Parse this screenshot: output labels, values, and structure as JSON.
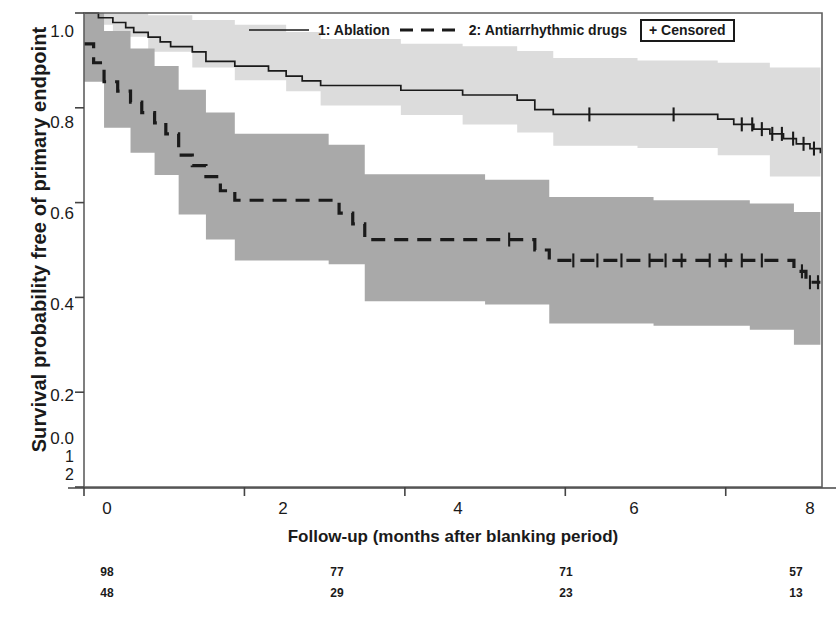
{
  "chart_data": {
    "type": "line",
    "chart_kind": "kaplan-meier-survival",
    "title": "",
    "xlabel": "Follow-up (months after blanking period)",
    "ylabel": "Survival probability free of primary endpoint",
    "xlim": [
      0,
      9.2
    ],
    "ylim": [
      0.0,
      1.0
    ],
    "xticks": [
      0,
      2,
      4,
      6,
      8
    ],
    "xtick_labels": [
      "0",
      "2",
      "4",
      "6",
      "8"
    ],
    "yticks": [
      0.0,
      0.2,
      0.4,
      0.6,
      0.8,
      1.0
    ],
    "ytick_labels": [
      "0.0",
      "0.2",
      "0.4",
      "0.6",
      "0.8",
      "1.0"
    ],
    "grid": false,
    "legend_position": "top-center",
    "legend": [
      {
        "key": "1",
        "label": "1: Ablation",
        "style": "solid"
      },
      {
        "key": "2",
        "label": "2: Antiarrhythmic drugs",
        "style": "dashed"
      },
      {
        "key": "censored",
        "label": "+ Censored",
        "style": "marker"
      }
    ],
    "colors": {
      "line": "#1a1a1a",
      "band_group1": "#dcdcdc",
      "band_group2": "#a9a9a9",
      "axis": "#555555",
      "text": "#1a1a1a"
    },
    "series": [
      {
        "name": "1: Ablation",
        "group": "1",
        "style": "solid",
        "steps": [
          [
            0.0,
            1.0
          ],
          [
            0.18,
            0.99
          ],
          [
            0.36,
            0.98
          ],
          [
            0.52,
            0.969
          ],
          [
            0.62,
            0.959
          ],
          [
            0.8,
            0.949
          ],
          [
            0.95,
            0.939
          ],
          [
            1.08,
            0.929
          ],
          [
            1.35,
            0.918
          ],
          [
            1.52,
            0.898
          ],
          [
            1.88,
            0.888
          ],
          [
            2.08,
            0.888
          ],
          [
            2.3,
            0.878
          ],
          [
            2.52,
            0.867
          ],
          [
            2.72,
            0.857
          ],
          [
            2.95,
            0.847
          ],
          [
            3.2,
            0.847
          ],
          [
            3.55,
            0.847
          ],
          [
            3.95,
            0.837
          ],
          [
            4.3,
            0.837
          ],
          [
            4.72,
            0.827
          ],
          [
            5.05,
            0.827
          ],
          [
            5.4,
            0.816
          ],
          [
            5.62,
            0.796
          ],
          [
            5.85,
            0.786
          ],
          [
            6.3,
            0.786
          ],
          [
            6.9,
            0.786
          ],
          [
            7.35,
            0.786
          ],
          [
            7.9,
            0.776
          ],
          [
            8.1,
            0.765
          ],
          [
            8.35,
            0.755
          ],
          [
            8.55,
            0.745
          ],
          [
            8.72,
            0.735
          ],
          [
            8.88,
            0.724
          ],
          [
            9.05,
            0.714
          ],
          [
            9.18,
            0.704
          ]
        ],
        "censored_times": [
          6.3,
          7.35,
          8.2,
          8.33,
          8.45,
          8.58,
          8.7,
          8.84,
          8.97,
          9.1
        ],
        "upper_band": [
          [
            0.0,
            1.0
          ],
          [
            0.36,
            1.0
          ],
          [
            0.8,
            0.995
          ],
          [
            1.35,
            0.985
          ],
          [
            1.88,
            0.975
          ],
          [
            2.52,
            0.96
          ],
          [
            2.95,
            0.945
          ],
          [
            3.95,
            0.935
          ],
          [
            4.72,
            0.93
          ],
          [
            5.4,
            0.92
          ],
          [
            5.85,
            0.905
          ],
          [
            6.9,
            0.9
          ],
          [
            7.9,
            0.895
          ],
          [
            8.55,
            0.885
          ],
          [
            9.18,
            0.875
          ]
        ],
        "lower_band": [
          [
            0.0,
            0.975
          ],
          [
            0.36,
            0.95
          ],
          [
            0.8,
            0.918
          ],
          [
            1.35,
            0.885
          ],
          [
            1.88,
            0.858
          ],
          [
            2.52,
            0.835
          ],
          [
            2.95,
            0.805
          ],
          [
            3.95,
            0.785
          ],
          [
            4.72,
            0.765
          ],
          [
            5.4,
            0.748
          ],
          [
            5.85,
            0.72
          ],
          [
            6.9,
            0.715
          ],
          [
            7.9,
            0.7
          ],
          [
            8.55,
            0.655
          ],
          [
            9.18,
            0.6
          ]
        ],
        "at_risk": [
          98,
          77,
          71,
          57
        ]
      },
      {
        "name": "2: Antiarrhythmic drugs",
        "group": "2",
        "style": "dashed",
        "steps": [
          [
            0.0,
            0.935
          ],
          [
            0.12,
            0.895
          ],
          [
            0.25,
            0.855
          ],
          [
            0.42,
            0.835
          ],
          [
            0.58,
            0.812
          ],
          [
            0.72,
            0.79
          ],
          [
            0.88,
            0.768
          ],
          [
            1.02,
            0.745
          ],
          [
            1.18,
            0.7
          ],
          [
            1.35,
            0.678
          ],
          [
            1.52,
            0.655
          ],
          [
            1.7,
            0.625
          ],
          [
            1.88,
            0.605
          ],
          [
            2.2,
            0.605
          ],
          [
            2.6,
            0.605
          ],
          [
            3.05,
            0.605
          ],
          [
            3.18,
            0.578
          ],
          [
            3.35,
            0.555
          ],
          [
            3.5,
            0.522
          ],
          [
            4.0,
            0.522
          ],
          [
            4.5,
            0.522
          ],
          [
            5.0,
            0.522
          ],
          [
            5.45,
            0.522
          ],
          [
            5.62,
            0.5
          ],
          [
            5.8,
            0.478
          ],
          [
            6.4,
            0.478
          ],
          [
            7.1,
            0.478
          ],
          [
            7.8,
            0.478
          ],
          [
            8.1,
            0.478
          ],
          [
            8.3,
            0.478
          ],
          [
            8.72,
            0.478
          ],
          [
            8.85,
            0.455
          ],
          [
            9.0,
            0.432
          ],
          [
            9.18,
            0.432
          ]
        ],
        "censored_times": [
          5.3,
          6.1,
          6.4,
          6.7,
          7.05,
          7.25,
          7.45,
          7.8,
          8.0,
          8.2,
          8.45,
          8.95,
          9.05,
          9.15
        ],
        "upper_band": [
          [
            0.0,
            1.0
          ],
          [
            0.25,
            0.962
          ],
          [
            0.58,
            0.925
          ],
          [
            0.88,
            0.888
          ],
          [
            1.18,
            0.838
          ],
          [
            1.52,
            0.79
          ],
          [
            1.88,
            0.745
          ],
          [
            3.05,
            0.722
          ],
          [
            3.5,
            0.66
          ],
          [
            5.0,
            0.648
          ],
          [
            5.8,
            0.612
          ],
          [
            7.1,
            0.605
          ],
          [
            8.3,
            0.598
          ],
          [
            8.85,
            0.58
          ],
          [
            9.18,
            0.568
          ]
        ],
        "lower_band": [
          [
            0.0,
            0.855
          ],
          [
            0.25,
            0.758
          ],
          [
            0.58,
            0.705
          ],
          [
            0.88,
            0.658
          ],
          [
            1.18,
            0.575
          ],
          [
            1.52,
            0.522
          ],
          [
            1.88,
            0.478
          ],
          [
            3.05,
            0.47
          ],
          [
            3.5,
            0.392
          ],
          [
            5.0,
            0.385
          ],
          [
            5.8,
            0.345
          ],
          [
            7.1,
            0.34
          ],
          [
            8.3,
            0.332
          ],
          [
            8.85,
            0.3
          ],
          [
            9.18,
            0.288
          ]
        ],
        "at_risk": [
          48,
          29,
          23,
          13
        ]
      }
    ],
    "at_risk_table": {
      "times": [
        0,
        2,
        4,
        6,
        8
      ],
      "shown_at": [
        0,
        2.6,
        5.2,
        8.6
      ],
      "rows": [
        {
          "group": "1",
          "values": [
            "98",
            "77",
            "71",
            "57"
          ]
        },
        {
          "group": "2",
          "values": [
            "48",
            "29",
            "23",
            "13"
          ]
        }
      ]
    },
    "group_row_labels": [
      "1",
      "2"
    ]
  },
  "axis": {
    "ylabel": "Survival probability free of primary endpoint",
    "xlabel": "Follow-up (months after blanking period)",
    "ytick_labels": [
      "1.0",
      "0.8",
      "0.6",
      "0.4",
      "0.2",
      "0.0"
    ],
    "xtick_labels": [
      "0",
      "2",
      "4",
      "6",
      "8"
    ],
    "group_labels": [
      "1",
      "2"
    ]
  },
  "legend": {
    "item1_label": "1: Ablation",
    "item2_label": "2: Antiarrhythmic drugs",
    "censored_label": "+ Censored"
  },
  "at_risk": {
    "row1": [
      "98",
      "77",
      "71",
      "57"
    ],
    "row2": [
      "48",
      "29",
      "23",
      "13"
    ]
  }
}
